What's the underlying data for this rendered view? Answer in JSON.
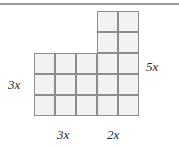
{
  "figure": {
    "name": "l-shaped-grid-figure",
    "colors": {
      "cell_fill": "#f2f2f2",
      "cell_border": "#8d8d8d",
      "rule": "#9a9a9a",
      "label_text": "#2b2b2b",
      "background": "#ffffff"
    },
    "geometry": {
      "cell_size": 21,
      "origin_x": 34,
      "origin_y": 11,
      "upper_block": {
        "cols": 2,
        "rows": 2,
        "col_offset": 3,
        "row_offset": 0
      },
      "lower_block": {
        "cols": 5,
        "rows": 3,
        "col_offset": 0,
        "row_offset": 2
      }
    }
  },
  "chart_data": {
    "type": "table",
    "title": "",
    "cells": [
      {
        "col": 3,
        "row": 0
      },
      {
        "col": 4,
        "row": 0
      },
      {
        "col": 3,
        "row": 1
      },
      {
        "col": 4,
        "row": 1
      },
      {
        "col": 0,
        "row": 2
      },
      {
        "col": 1,
        "row": 2
      },
      {
        "col": 2,
        "row": 2
      },
      {
        "col": 3,
        "row": 2
      },
      {
        "col": 4,
        "row": 2
      },
      {
        "col": 0,
        "row": 3
      },
      {
        "col": 1,
        "row": 3
      },
      {
        "col": 2,
        "row": 3
      },
      {
        "col": 3,
        "row": 3
      },
      {
        "col": 4,
        "row": 3
      },
      {
        "col": 0,
        "row": 4
      },
      {
        "col": 1,
        "row": 4
      },
      {
        "col": 2,
        "row": 4
      },
      {
        "col": 3,
        "row": 4
      },
      {
        "col": 4,
        "row": 4
      }
    ],
    "total_cells": 19,
    "grid_cols": 5,
    "grid_rows": 5
  },
  "labels": {
    "left": "3x",
    "right": "5x",
    "bottom_left": "3x",
    "bottom_right": "2x"
  }
}
